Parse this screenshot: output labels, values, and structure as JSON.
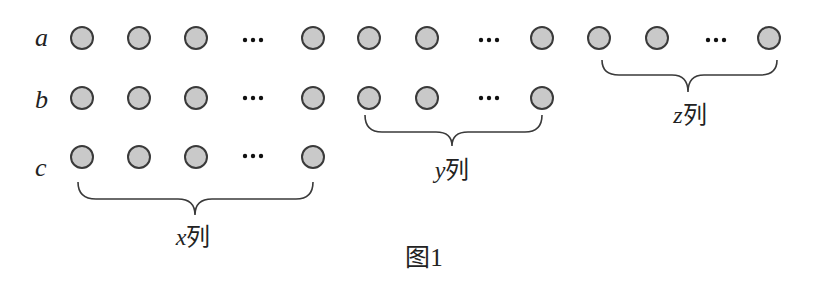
{
  "figure": {
    "caption": "图1",
    "rows": [
      {
        "label": "a",
        "y": 38,
        "bead_x": [
          82,
          139,
          196,
          313,
          369,
          427,
          542,
          599,
          657,
          769
        ],
        "ellipsis_x": [
          253,
          489,
          716
        ]
      },
      {
        "label": "b",
        "y": 98,
        "bead_x": [
          82,
          139,
          196,
          313,
          369,
          427,
          542
        ],
        "ellipsis_x": [
          253,
          489
        ]
      },
      {
        "label": "c",
        "y": 157,
        "bead_x": [
          82,
          139,
          196,
          313
        ],
        "ellipsis_x": [
          253
        ]
      }
    ],
    "groups": [
      {
        "var": "x",
        "suffix": "列",
        "label": "x列"
      },
      {
        "var": "y",
        "suffix": "列",
        "label": "y列"
      },
      {
        "var": "z",
        "suffix": "列",
        "label": "z列"
      }
    ],
    "ellipsis": "···",
    "colors": {
      "bead_fill": "#c9c9c9",
      "bead_stroke": "#3a3a3a",
      "text": "#222222"
    }
  }
}
